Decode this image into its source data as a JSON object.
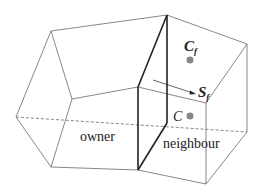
{
  "diagram": {
    "type": "finite-volume mesh cells",
    "labels": {
      "owner": "owner",
      "neighbour": "neighbour",
      "face_centroid": "C",
      "face_centroid_sub": "f",
      "cell_centre": "C",
      "face_area_vector": "S",
      "face_area_vector_sub": "f"
    },
    "colors": {
      "edge": "#555555",
      "shared_face": "#222222",
      "point": "#888888"
    }
  }
}
